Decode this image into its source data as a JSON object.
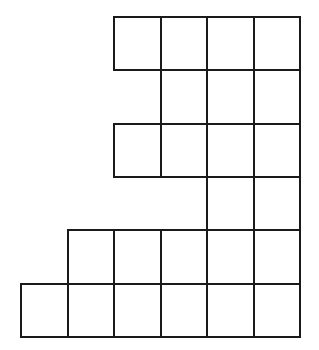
{
  "figure": {
    "type": "square-grid-shape",
    "line_color": "#1a1a1a",
    "background": "#ffffff",
    "origin": {
      "x": 21,
      "y": 17
    },
    "cell_width": 46.5,
    "cell_height": 53.3,
    "columns": 6,
    "rows": [
      {
        "row": 0,
        "cols": [
          2,
          3,
          4,
          5
        ]
      },
      {
        "row": 1,
        "cols": [
          3,
          4,
          5
        ]
      },
      {
        "row": 2,
        "cols": [
          2,
          3,
          4,
          5
        ]
      },
      {
        "row": 3,
        "cols": [
          4,
          5
        ]
      },
      {
        "row": 4,
        "cols": [
          1,
          2,
          3,
          4,
          5
        ]
      },
      {
        "row": 5,
        "cols": [
          0,
          1,
          2,
          3,
          4,
          5
        ]
      }
    ],
    "total_squares": 24
  }
}
